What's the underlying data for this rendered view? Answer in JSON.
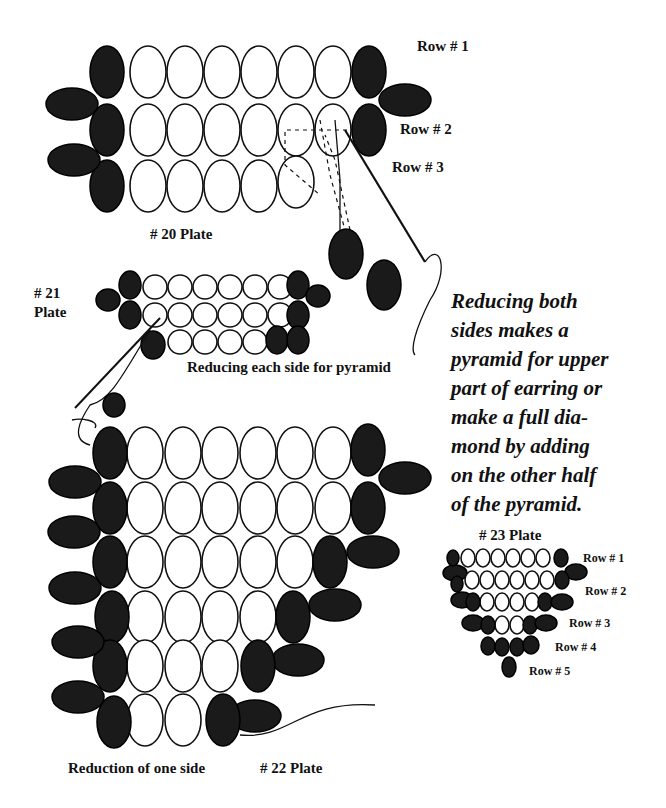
{
  "plate20": {
    "title": "# 20 Plate",
    "rows": [
      "Row # 1",
      "Row # 2",
      "Row # 3"
    ]
  },
  "plate21": {
    "title_line1": "# 21",
    "title_line2": "Plate",
    "caption": "Reducing each side for pyramid"
  },
  "description": {
    "lines": [
      "Reducing both",
      "sides makes a",
      "pyramid for upper",
      "part of earring or",
      "make a full dia-",
      "mond by adding",
      "on the other half",
      "of the pyramid."
    ]
  },
  "plate22": {
    "caption": "Reduction of one side",
    "title": "# 22 Plate"
  },
  "plate23": {
    "title": "# 23 Plate",
    "rows": [
      "Row # 1",
      "Row # 2",
      "Row # 3",
      "Row # 4",
      "Row # 5"
    ]
  },
  "colors": {
    "ink": "#111111",
    "paper": "#ffffff"
  }
}
